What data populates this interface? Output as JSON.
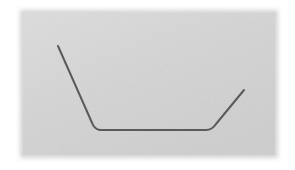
{
  "image": {
    "width": 295,
    "height": 170,
    "background_color": "#ffffff",
    "description": "Hand-drawn style polyline forming a wide flat-bottomed V (trough shape) on a light gray textured panel"
  },
  "panel": {
    "name": "gray-paper-panel",
    "x": 20,
    "y": 10,
    "width": 258,
    "height": 148,
    "fill_color": "#d4d4d4",
    "highlight_color": "#dedede",
    "shadow_color": "#c9c9c9",
    "edge_softness_px": 5,
    "texture": "fine-noise"
  },
  "drawing": {
    "name": "trough-polyline",
    "stroke_color": "#5a5a5a",
    "stroke_width": 2,
    "linecap": "round",
    "linejoin": "round",
    "fill": "none",
    "points": [
      {
        "label": "left-top-endpoint",
        "x": 58,
        "y": 46
      },
      {
        "label": "left-bottom-corner",
        "x": 96,
        "y": 130
      },
      {
        "label": "right-bottom-corner",
        "x": 212,
        "y": 130
      },
      {
        "label": "right-top-endpoint",
        "x": 244,
        "y": 90
      }
    ],
    "path_d": "M 58 46 L 93 125 Q 96 130 101 130 L 206 130 Q 212 130 216 124 L 244 90",
    "segments": [
      {
        "label": "left-descending-stroke",
        "from": "left-top-endpoint",
        "to": "left-bottom-corner"
      },
      {
        "label": "bottom-horizontal-stroke",
        "from": "left-bottom-corner",
        "to": "right-bottom-corner"
      },
      {
        "label": "right-ascending-stroke",
        "from": "right-bottom-corner",
        "to": "right-top-endpoint"
      }
    ]
  }
}
